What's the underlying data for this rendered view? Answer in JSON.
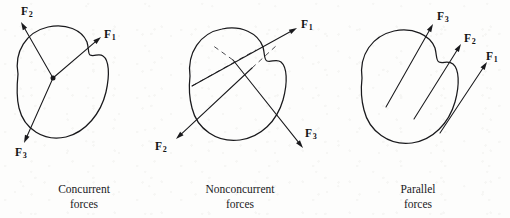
{
  "figure": {
    "type": "force-system-classification-diagram",
    "background_color": "#fdfdfc",
    "ink_color": "#19191c",
    "dashed_line_color": "#4a4a4f",
    "width": 510,
    "height": 218
  },
  "panels": [
    {
      "id": "concurrent",
      "caption_line1": "Concurrent",
      "caption_line2": "forces",
      "caption_center_x": 84,
      "caption_top": 182,
      "has_concurrency_point": true,
      "concurrency_point": {
        "x": 53,
        "y": 78
      },
      "body_outline": "M 18 74 C 14 52, 26 32, 48 27 C 66 23, 82 30, 87 42 C 89 49, 88 54, 90 55 C 94 57, 99 53, 103 56 C 109 60, 110 74, 106 92 C 101 113, 86 132, 66 137 C 44 142, 24 129, 19 108 C 16 96, 17 84, 18 74 Z",
      "forces": [
        {
          "name": "F1",
          "label_base": "F",
          "label_sub": "1",
          "tail": {
            "x": 53,
            "y": 78
          },
          "tip": {
            "x": 101,
            "y": 37
          },
          "label_x": 104,
          "label_y": 29
        },
        {
          "name": "F2",
          "label_base": "F",
          "label_sub": "2",
          "tail": {
            "x": 53,
            "y": 78
          },
          "tip": {
            "x": 21,
            "y": 22
          },
          "label_x": 21,
          "label_y": 6
        },
        {
          "name": "F3",
          "label_base": "F",
          "label_sub": "3",
          "tail": {
            "x": 53,
            "y": 78
          },
          "tip": {
            "x": 24,
            "y": 143
          },
          "label_x": 15,
          "label_y": 147
        }
      ],
      "action_lines": []
    },
    {
      "id": "nonconcurrent",
      "caption_line1": "Nonconcurrent",
      "caption_line2": "forces",
      "caption_center_x": 240,
      "caption_top": 182,
      "has_concurrency_point": false,
      "body_outline": "M 190 76 C 187 53, 200 33, 222 29 C 241 25, 258 33, 263 47 C 265 55, 264 60, 267 61 C 271 63, 276 58, 281 62 C 287 67, 288 82, 283 100 C 277 121, 261 137, 240 140 C 217 143, 197 129, 192 108 C 189 97, 189 85, 190 76 Z",
      "forces": [
        {
          "name": "F1",
          "label_base": "F",
          "label_sub": "1",
          "tail": {
            "x": 192,
            "y": 86
          },
          "tip": {
            "x": 297,
            "y": 28
          },
          "label_x": 301,
          "label_y": 19
        },
        {
          "name": "F2",
          "label_base": "F",
          "label_sub": "2",
          "tail": {
            "x": 252,
            "y": 68
          },
          "tip": {
            "x": 176,
            "y": 139
          },
          "label_x": 155,
          "label_y": 141
        },
        {
          "name": "F3",
          "label_base": "F",
          "label_sub": "3",
          "tail": {
            "x": 233,
            "y": 60
          },
          "tip": {
            "x": 303,
            "y": 148
          },
          "label_x": 305,
          "label_y": 128
        }
      ],
      "action_lines": [
        {
          "x1": 192,
          "y1": 86,
          "x2": 256,
          "y2": 50
        },
        {
          "x1": 252,
          "y1": 68,
          "x2": 277,
          "y2": 45
        },
        {
          "x1": 233,
          "y1": 60,
          "x2": 212,
          "y2": 45
        }
      ]
    },
    {
      "id": "parallel",
      "caption_line1": "Parallel",
      "caption_line2": "forces",
      "caption_center_x": 418,
      "caption_top": 182,
      "has_concurrency_point": false,
      "body_outline": "M 362 78 C 359 55, 372 36, 394 31 C 413 27, 430 35, 435 48 C 437 56, 436 61, 439 62 C 443 64, 448 60, 453 64 C 459 69, 460 84, 455 102 C 449 123, 433 140, 412 143 C 389 146, 369 131, 364 110 C 361 99, 361 87, 362 78 Z",
      "forces": [
        {
          "name": "F3",
          "label_base": "F",
          "label_sub": "3",
          "tail": {
            "x": 386,
            "y": 107
          },
          "tip": {
            "x": 433,
            "y": 24
          },
          "label_x": 437,
          "label_y": 11
        },
        {
          "name": "F2",
          "label_base": "F",
          "label_sub": "2",
          "tail": {
            "x": 414,
            "y": 119
          },
          "tip": {
            "x": 461,
            "y": 44
          },
          "label_x": 464,
          "label_y": 33
        },
        {
          "name": "F1",
          "label_base": "F",
          "label_sub": "1",
          "tail": {
            "x": 440,
            "y": 133
          },
          "tip": {
            "x": 487,
            "y": 62
          },
          "label_x": 486,
          "label_y": 51
        }
      ],
      "action_lines": []
    }
  ]
}
